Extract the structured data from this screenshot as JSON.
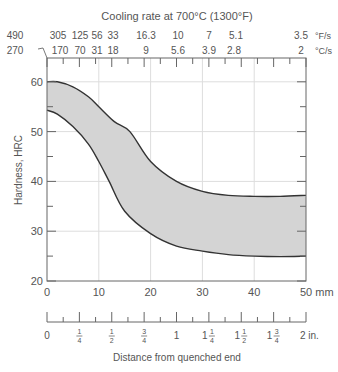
{
  "chart_data": {
    "type": "area",
    "title": "Cooling rate at 700°C (1300°F)",
    "xlabel": "Distance from quenched end",
    "ylabel": "Hardness, HRC",
    "xlim": [
      0,
      50
    ],
    "ylim": [
      20,
      65
    ],
    "grid": true,
    "x_ticks_mm": [
      "0",
      "10",
      "20",
      "30",
      "40",
      "50 mm"
    ],
    "y_ticks": [
      "20",
      "30",
      "40",
      "50",
      "60"
    ],
    "x_ticks_in": [
      "0",
      "1/4",
      "1/2",
      "3/4",
      "1",
      "1 1/4",
      "1 1/2",
      "1 3/4",
      "2 in."
    ],
    "cooling_rate_F": {
      "unit": "°F/s",
      "labels": [
        "490",
        "305",
        "125",
        "56",
        "33",
        "16.3",
        "10",
        "7",
        "5.1",
        "3.5"
      ]
    },
    "cooling_rate_C": {
      "unit": "°C/s",
      "labels": [
        "270",
        "170",
        "70",
        "31",
        "18",
        "9",
        "5.6",
        "3.9",
        "2.8",
        "2"
      ]
    },
    "series": [
      {
        "name": "Upper band (max hardness)",
        "x": [
          0,
          2,
          5,
          8,
          10,
          13,
          16,
          20,
          25,
          30,
          35,
          40,
          45,
          50
        ],
        "values": [
          60,
          60,
          59,
          57,
          55,
          52,
          50,
          44,
          40,
          38,
          37.2,
          37,
          37,
          37.2
        ]
      },
      {
        "name": "Lower band (min hardness)",
        "x": [
          0,
          2,
          5,
          8,
          10,
          12,
          15,
          20,
          25,
          30,
          35,
          40,
          45,
          50
        ],
        "values": [
          54.3,
          53.5,
          51,
          47.5,
          44,
          40,
          34,
          29.5,
          27,
          26,
          25.3,
          25,
          24.9,
          25
        ]
      }
    ],
    "band_fill": "#d4d4d4"
  },
  "labels": {
    "title": "Cooling rate at 700°C (1300°F)",
    "f_unit": "°F/s",
    "c_unit": "°C/s",
    "ylabel": "Hardness, HRC",
    "xlabel": "Distance from quenched end",
    "mm_unit": "50 mm",
    "in_unit": "2 in."
  }
}
